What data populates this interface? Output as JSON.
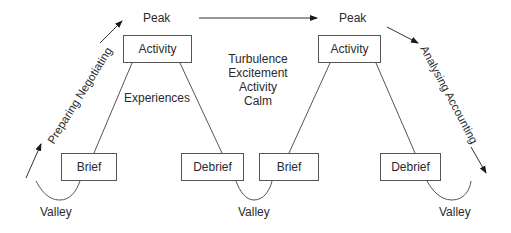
{
  "diagram": {
    "peaks": [
      {
        "label": "Peak"
      },
      {
        "label": "Peak"
      }
    ],
    "valleys": [
      {
        "label": "Valley"
      },
      {
        "label": "Valley"
      },
      {
        "label": "Valley"
      }
    ],
    "cycles": [
      {
        "top_box": "Activity",
        "left_box": "Brief",
        "right_box": "Debrief",
        "inner_label": "Experiences"
      },
      {
        "top_box": "Activity",
        "left_box": "Brief",
        "right_box": "Debrief"
      }
    ],
    "states": [
      "Turbulence",
      "Excitement",
      "Activity",
      "Calm"
    ],
    "rising_label": "Preparing Negotiating",
    "falling_label": "Analysing Accounting",
    "colors": {
      "line": "#555555",
      "text": "#2b2b2b",
      "background": "#ffffff"
    }
  }
}
